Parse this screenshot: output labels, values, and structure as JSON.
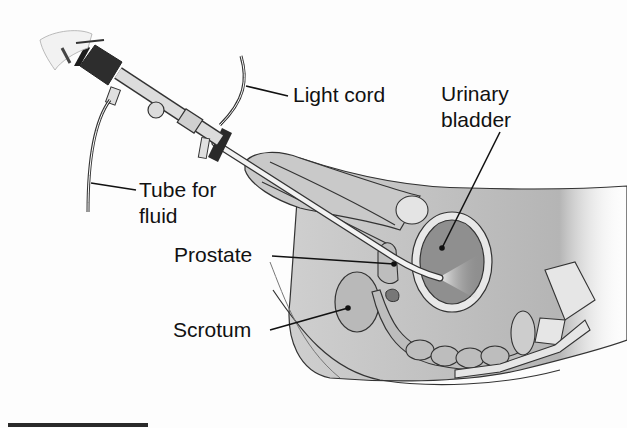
{
  "figure": {
    "type": "anatomical-illustration",
    "labels": {
      "light_cord": "Light cord",
      "urinary_bladder_line1": "Urinary",
      "urinary_bladder_line2": "bladder",
      "tube_line1": "Tube for",
      "tube_line2": "fluid",
      "prostate": "Prostate",
      "scrotum": "Scrotum"
    },
    "colors": {
      "tissue_light": "#d8d8d8",
      "tissue_mid": "#a9a9a9",
      "tissue_dark": "#8a8a8a",
      "instrument_dark": "#2a2a2a",
      "outline": "#222222"
    }
  }
}
